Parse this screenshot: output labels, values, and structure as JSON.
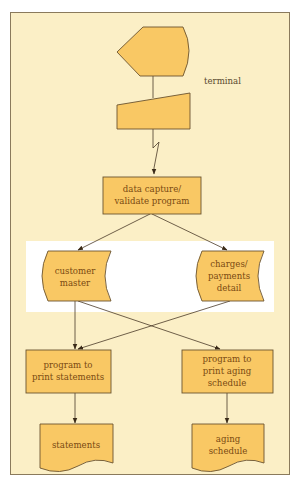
{
  "colors": {
    "background": "#fbefc6",
    "border": "#8a7a5c",
    "shape_fill": "#f9c864",
    "shape_stroke": "#6b5430",
    "label_text": "#7a4a12",
    "highlight_band": "#ffffff"
  },
  "nodes": {
    "display": {
      "shape": "display",
      "label": ""
    },
    "manual_input": {
      "shape": "manual-input",
      "label": ""
    },
    "terminal_note": "terminal",
    "data_capture": {
      "shape": "process",
      "lines": [
        "data capture/",
        "validate program"
      ]
    },
    "customer_master": {
      "shape": "stored-data",
      "lines": [
        "customer",
        "master"
      ]
    },
    "charges_payments": {
      "shape": "stored-data",
      "lines": [
        "charges/",
        "payments",
        "detail"
      ]
    },
    "print_statements": {
      "shape": "process",
      "lines": [
        "program to",
        "print statements"
      ]
    },
    "print_aging": {
      "shape": "process",
      "lines": [
        "program to",
        "print aging",
        "schedule"
      ]
    },
    "statements": {
      "shape": "document",
      "lines": [
        "statements"
      ]
    },
    "aging_schedule": {
      "shape": "document",
      "lines": [
        "aging",
        "schedule"
      ]
    }
  },
  "edges": [
    {
      "from": "display",
      "to": "manual_input",
      "type": "line"
    },
    {
      "from": "manual_input",
      "to": "data_capture",
      "type": "communication-link"
    },
    {
      "from": "data_capture",
      "to": "customer_master",
      "type": "arrow"
    },
    {
      "from": "data_capture",
      "to": "charges_payments",
      "type": "arrow"
    },
    {
      "from": "customer_master",
      "to": "print_statements",
      "type": "arrow"
    },
    {
      "from": "customer_master",
      "to": "print_aging",
      "type": "arrow"
    },
    {
      "from": "charges_payments",
      "to": "print_statements",
      "type": "arrow"
    },
    {
      "from": "print_statements",
      "to": "statements",
      "type": "arrow"
    },
    {
      "from": "print_aging",
      "to": "aging_schedule",
      "type": "arrow"
    }
  ]
}
